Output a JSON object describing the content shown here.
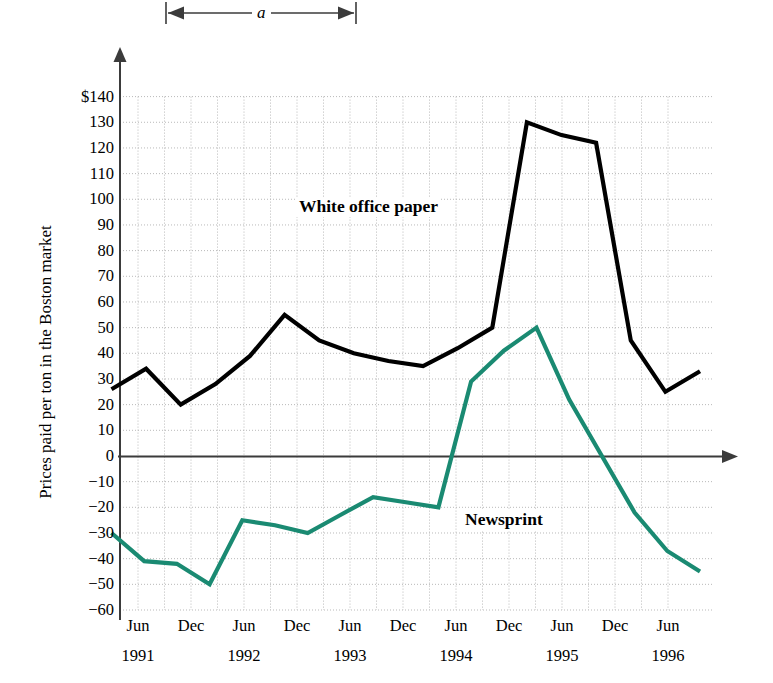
{
  "figure": {
    "y_axis_title": "Prices paid per ton in the Boston market",
    "currency_prefix": "$",
    "dimension_annotation": {
      "label": "a",
      "name": "dimension-a"
    }
  },
  "chart_data": {
    "type": "line",
    "title": "",
    "xlabel": "",
    "ylabel": "Prices paid per ton in the Boston market",
    "ylim": [
      -60,
      140
    ],
    "ytick_step": 10,
    "grid": true,
    "legend_position": "inline-direct-labels",
    "ytick_labels": [
      "$140",
      "130",
      "120",
      "110",
      "100",
      "90",
      "80",
      "70",
      "60",
      "50",
      "40",
      "30",
      "20",
      "10",
      "0",
      "−10",
      "−20",
      "−30",
      "−40",
      "−50",
      "−60"
    ],
    "ytick_values": [
      140,
      130,
      120,
      110,
      100,
      90,
      80,
      70,
      60,
      50,
      40,
      30,
      20,
      10,
      0,
      -10,
      -20,
      -30,
      -40,
      -50,
      -60
    ],
    "xtick_months": [
      "Jun",
      "Dec",
      "Jun",
      "Dec",
      "Jun",
      "Dec",
      "Jun",
      "Dec",
      "Jun",
      "Dec",
      "Jun"
    ],
    "xtick_years": [
      "1991",
      "",
      "1992",
      "",
      "1993",
      "",
      "1994",
      "",
      "1995",
      "",
      "1996"
    ],
    "x_labels": [
      "Jun 1991",
      "Dec 1991",
      "Jun 1992",
      "Dec 1992",
      "Jun 1993",
      "Dec 1993",
      "Jun 1994",
      "Dec 1994",
      "Jun 1995",
      "Dec 1995",
      "Jun 1996"
    ],
    "series": [
      {
        "name": "White office paper",
        "color": "#000000",
        "values": [
          26,
          34,
          20,
          28,
          39,
          55,
          45,
          40,
          37,
          35,
          42,
          50,
          130,
          125,
          122,
          45,
          25,
          33
        ]
      },
      {
        "name": "Newsprint",
        "color": "#1a8a72",
        "values": [
          -30,
          -41,
          -42,
          -50,
          -25,
          -27,
          -30,
          -23,
          -16,
          -18,
          -20,
          29,
          41,
          50,
          22,
          0,
          -22,
          -37,
          -45
        ]
      }
    ]
  }
}
